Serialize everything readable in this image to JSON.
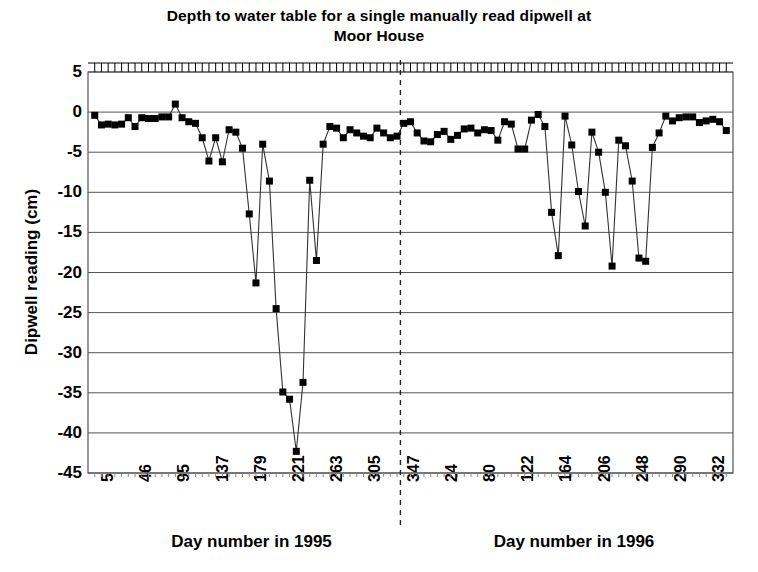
{
  "chart_data": {
    "type": "line",
    "title": "Depth to water table for a single manually read dipwell at Moor House",
    "title_line1": "Depth to water table for a single manually read dipwell at",
    "title_line2": "Moor House",
    "ylabel": "Dipwell reading (cm)",
    "xlabel": "",
    "xlabel_left": "Day number in 1995",
    "xlabel_right": "Day number in 1996",
    "ylim": [
      -45,
      5
    ],
    "yticks": [
      5,
      0,
      -5,
      -10,
      -15,
      -20,
      -25,
      -30,
      -35,
      -40,
      -45
    ],
    "ytick_labels": [
      "5",
      "0",
      "-5",
      "-10",
      "-15",
      "-20",
      "-25",
      "-30",
      "-35",
      "-40",
      "-45"
    ],
    "grid": true,
    "grid_axis": "y",
    "legend": false,
    "marker": "filled-square",
    "marker_color": "#000000",
    "line_color": "#333333",
    "xtick_labels_1995": [
      "5",
      "46",
      "95",
      "137",
      "179",
      "221",
      "263",
      "305",
      "347"
    ],
    "xtick_labels_1996": [
      "24",
      "80",
      "122",
      "164",
      "206",
      "248",
      "290",
      "332"
    ],
    "xtick_labels": [
      "5",
      "46",
      "95",
      "137",
      "179",
      "221",
      "263",
      "305",
      "347",
      "24",
      "80",
      "122",
      "164",
      "206",
      "248",
      "290",
      "332"
    ],
    "divider": {
      "label": "year boundary",
      "style": "dashed",
      "position_index": 46
    },
    "series": [
      {
        "name": "Dipwell reading",
        "values": [
          -0.4,
          -1.6,
          -1.5,
          -1.6,
          -1.5,
          -0.7,
          -1.8,
          -0.7,
          -0.8,
          -0.8,
          -0.6,
          -0.6,
          1.0,
          -0.7,
          -1.2,
          -1.4,
          -3.2,
          -6.1,
          -3.2,
          -6.2,
          -2.2,
          -2.5,
          -4.5,
          -12.7,
          -21.3,
          -4.0,
          -8.6,
          -24.5,
          -34.9,
          -35.8,
          -42.3,
          -33.7,
          -8.5,
          -18.5,
          -4.0,
          -1.8,
          -2.0,
          -3.2,
          -2.2,
          -2.6,
          -3.0,
          -3.2,
          -2.0,
          -2.6,
          -3.2,
          -3.0,
          -1.4,
          -1.2,
          -2.6,
          -3.6,
          -3.7,
          -2.8,
          -2.4,
          -3.4,
          -2.9,
          -2.1,
          -2.0,
          -2.6,
          -2.2,
          -2.3,
          -3.5,
          -1.2,
          -1.5,
          -4.6,
          -4.6,
          -1.0,
          -0.3,
          -1.8,
          -12.5,
          -17.9,
          -0.5,
          -4.1,
          -9.9,
          -14.2,
          -2.5,
          -5.0,
          -10.0,
          -19.2,
          -3.5,
          -4.2,
          -8.6,
          -18.2,
          -18.6,
          -4.4,
          -2.6,
          -0.5,
          -1.1,
          -0.7,
          -0.6,
          -0.6,
          -1.3,
          -1.1,
          -0.9,
          -1.2,
          -2.3
        ]
      }
    ],
    "plot_area": {
      "x0": 88,
      "x1": 733,
      "y0": 72,
      "y1": 473
    }
  }
}
